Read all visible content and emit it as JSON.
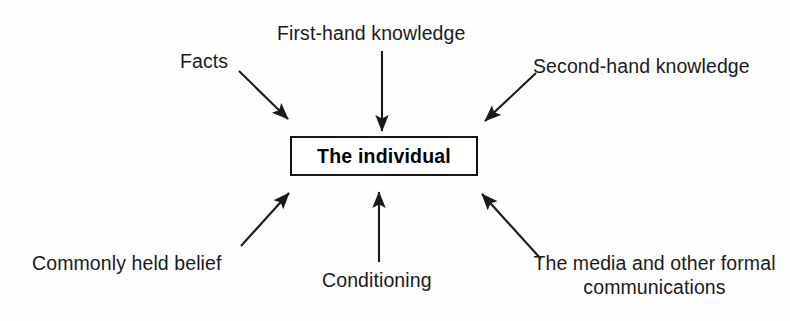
{
  "diagram": {
    "title": "The individual",
    "center": {
      "label": "The individual",
      "box": {
        "x": 290,
        "y": 136,
        "width": 188,
        "height": 40
      },
      "border_color": "#161616",
      "fill_color": "#ffffff"
    },
    "background_color": "#fefefe",
    "line_color": "#1a1a1a",
    "text_color": "#1a1a1a",
    "sources": [
      {
        "id": "facts",
        "label": "Facts",
        "label_x": 180,
        "label_y": 50,
        "align": "left",
        "arrow": {
          "x1": 239,
          "y1": 71,
          "x2": 288,
          "y2": 119
        }
      },
      {
        "id": "first-hand-knowledge",
        "label": "First-hand knowledge",
        "label_x": 277,
        "label_y": 22,
        "align": "left",
        "arrow": {
          "x1": 382,
          "y1": 51,
          "x2": 382,
          "y2": 131
        }
      },
      {
        "id": "second-hand-knowledge",
        "label": "Second-hand knowledge",
        "label_x": 533,
        "label_y": 55,
        "align": "left",
        "arrow": {
          "x1": 536,
          "y1": 73,
          "x2": 485,
          "y2": 121
        }
      },
      {
        "id": "commonly-held-belief",
        "label": "Commonly held belief",
        "label_x": 32,
        "label_y": 252,
        "align": "left",
        "arrow": {
          "x1": 241,
          "y1": 246,
          "x2": 289,
          "y2": 193
        }
      },
      {
        "id": "conditioning",
        "label": "Conditioning",
        "label_x": 322,
        "label_y": 269,
        "align": "left",
        "arrow": {
          "x1": 379,
          "y1": 262,
          "x2": 379,
          "y2": 192
        }
      },
      {
        "id": "media-and-formal-communications",
        "label": "The media and other\nformal communications",
        "label_x": 519,
        "label_y": 252,
        "align": "center",
        "arrow": {
          "x1": 541,
          "y1": 259,
          "x2": 482,
          "y2": 194
        }
      }
    ]
  }
}
